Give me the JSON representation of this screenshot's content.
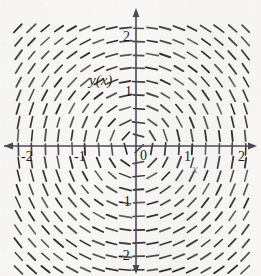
{
  "figure": {
    "kind": "slope-field",
    "background_color": "#f8f7f5",
    "ink_color": "#2b2b2b",
    "axis_color": "#4a4a52",
    "width": 261,
    "height": 276
  },
  "labels": {
    "y_axis_name": "y(x)",
    "x_axis_name": "x"
  },
  "axes": {
    "x_ticks": [
      {
        "value": -2,
        "text": "-2"
      },
      {
        "value": -1,
        "text": "-1"
      },
      {
        "value": 1,
        "text": "1"
      },
      {
        "value": 2,
        "text": "2"
      }
    ],
    "y_ticks": [
      {
        "value": 2,
        "text": "2"
      },
      {
        "value": 1,
        "text": "1"
      },
      {
        "value": -1,
        "text": "-1"
      },
      {
        "value": -2,
        "text": "-2"
      }
    ],
    "origin_label": "0"
  },
  "chart_data": {
    "type": "scatter",
    "title": "",
    "xlabel": "x",
    "ylabel": "y(x)",
    "xlim": [
      -2.24,
      2.17
    ],
    "ylim": [
      -2.29,
      2.17
    ],
    "grid": false,
    "legend": null,
    "field": {
      "description": "Direction field of dy/dx = -x/y : short tangent dashes on a uniform grid; integral curves are concentric circles about the origin.",
      "slope_formula": "-x/y",
      "x_start": -2.2,
      "x_end": 2.15,
      "y_start": -2.25,
      "y_end": 2.15,
      "x_step": 0.25,
      "y_step": 0.244,
      "dash_length_px": 11,
      "dash_width_px": 1.7
    },
    "tick_values_x": [
      -2,
      -1,
      1,
      2
    ],
    "tick_values_y": [
      -2,
      -1,
      1,
      2
    ]
  },
  "geometry": {
    "origin_px": {
      "x": 136,
      "y": 146
    },
    "unit_px": {
      "x": 53.5,
      "y": 55
    },
    "x_axis_arrow_left_px": 4,
    "x_axis_arrow_right_px": 257,
    "y_axis_arrow_top_px": 8,
    "y_axis_arrow_bottom_px": 272
  }
}
